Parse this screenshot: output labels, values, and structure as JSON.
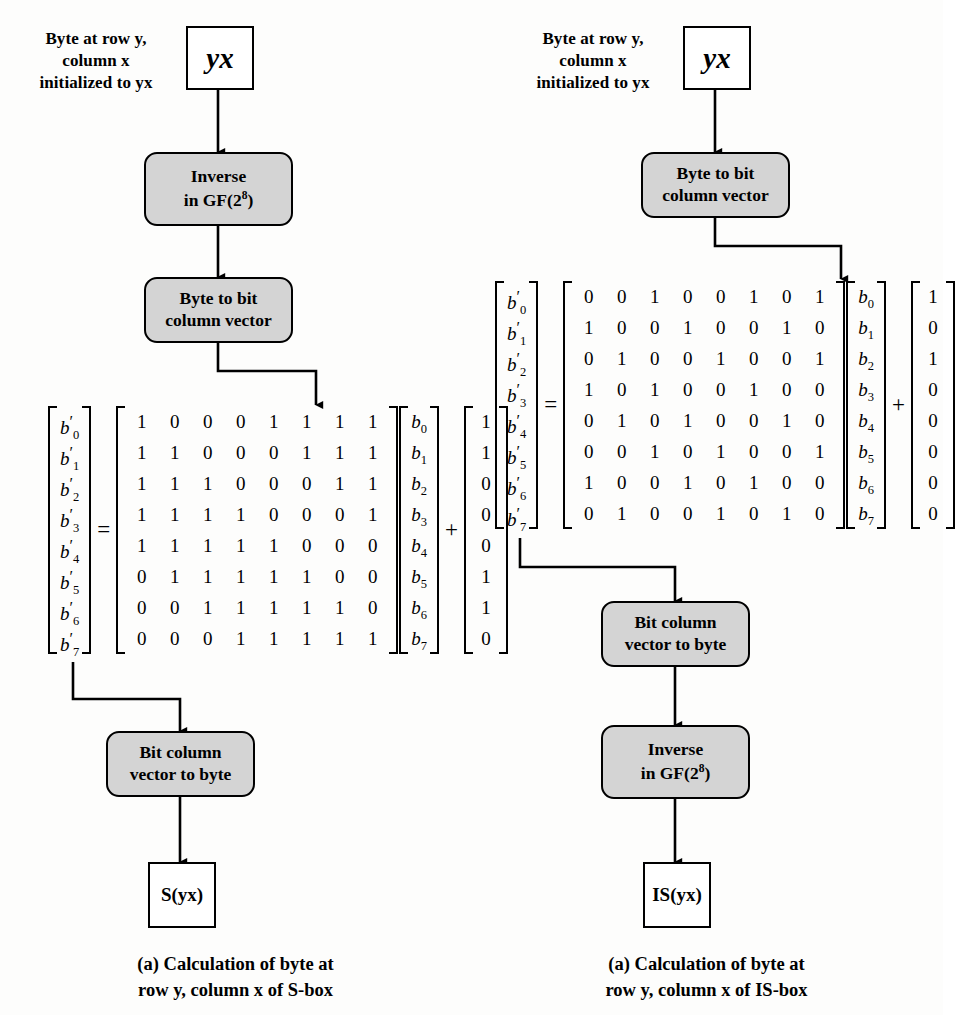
{
  "figure": {
    "background_color": "#fdfdfc",
    "box_fill_color": "#d4d4d4",
    "line_color": "#000000"
  },
  "left_panel": {
    "note_line1": "Byte at row y,",
    "note_line2": "column x",
    "note_line3": "initialized to yx",
    "input_box_label": "yx",
    "step1_line1": "Inverse",
    "step1_line2": "in GF(2",
    "step1_exp": "8",
    "step1_line2_end": ")",
    "step2_line1": "Byte to bit",
    "step2_line2": "column vector",
    "step3_line1": "Bit column",
    "step3_line2": "vector to byte",
    "output_box_label": "S(yx)",
    "caption_line1": "(a) Calculation of byte at",
    "caption_line2": "row y, column x of S-box",
    "equation": {
      "result_labels": [
        "b'0",
        "b'1",
        "b'2",
        "b'3",
        "b'4",
        "b'5",
        "b'6",
        "b'7"
      ],
      "equals": "=",
      "matrix": [
        [
          1,
          0,
          0,
          0,
          1,
          1,
          1,
          1
        ],
        [
          1,
          1,
          0,
          0,
          0,
          1,
          1,
          1
        ],
        [
          1,
          1,
          1,
          0,
          0,
          0,
          1,
          1
        ],
        [
          1,
          1,
          1,
          1,
          0,
          0,
          0,
          1
        ],
        [
          1,
          1,
          1,
          1,
          1,
          0,
          0,
          0
        ],
        [
          0,
          1,
          1,
          1,
          1,
          1,
          0,
          0
        ],
        [
          0,
          0,
          1,
          1,
          1,
          1,
          1,
          0
        ],
        [
          0,
          0,
          0,
          1,
          1,
          1,
          1,
          1
        ]
      ],
      "input_labels": [
        "b0",
        "b1",
        "b2",
        "b3",
        "b4",
        "b5",
        "b6",
        "b7"
      ],
      "plus": "+",
      "constant": [
        1,
        1,
        0,
        0,
        0,
        1,
        1,
        0
      ]
    }
  },
  "right_panel": {
    "note_line1": "Byte at row y,",
    "note_line2": "column x",
    "note_line3": "initialized to yx",
    "input_box_label": "yx",
    "step1_line1": "Byte to bit",
    "step1_line2": "column vector",
    "step2_line1": "Bit column",
    "step2_line2": "vector to byte",
    "step3_line1": "Inverse",
    "step3_line2": "in GF(2",
    "step3_exp": "8",
    "step3_line2_end": ")",
    "output_box_label": "IS(yx)",
    "caption_line1": "(a) Calculation of byte at",
    "caption_line2": "row y, column x of IS-box",
    "equation": {
      "result_labels": [
        "b'0",
        "b'1",
        "b'2",
        "b'3",
        "b'4",
        "b'5",
        "b'6",
        "b'7"
      ],
      "equals": "=",
      "matrix": [
        [
          0,
          0,
          1,
          0,
          0,
          1,
          0,
          1
        ],
        [
          1,
          0,
          0,
          1,
          0,
          0,
          1,
          0
        ],
        [
          0,
          1,
          0,
          0,
          1,
          0,
          0,
          1
        ],
        [
          1,
          0,
          1,
          0,
          0,
          1,
          0,
          0
        ],
        [
          0,
          1,
          0,
          1,
          0,
          0,
          1,
          0
        ],
        [
          0,
          0,
          1,
          0,
          1,
          0,
          0,
          1
        ],
        [
          1,
          0,
          0,
          1,
          0,
          1,
          0,
          0
        ],
        [
          0,
          1,
          0,
          0,
          1,
          0,
          1,
          0
        ]
      ],
      "input_labels": [
        "b0",
        "b1",
        "b2",
        "b3",
        "b4",
        "b5",
        "b6",
        "b7"
      ],
      "plus": "+",
      "constant": [
        1,
        0,
        1,
        0,
        0,
        0,
        0,
        0
      ]
    }
  }
}
